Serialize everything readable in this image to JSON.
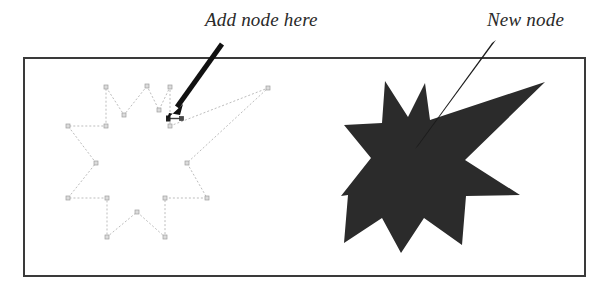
{
  "figure": {
    "name": "node-editing-illustration",
    "background_color": "#ffffff",
    "frame": {
      "name": "illustration-frame",
      "x": 23,
      "y": 57,
      "width": 563,
      "height": 220,
      "border_color": "#3a3a3a",
      "border_width": 2,
      "fill_color": "#ffffff"
    }
  },
  "annotations": [
    {
      "id": "add-node-here",
      "label": "Add node here",
      "text_color": "#2a2a2a",
      "font_style": "italic-serif",
      "font_size": 19,
      "pointer": {
        "type": "thick-solid-arrow",
        "color": "#111111",
        "from_x": 222,
        "from_y": 44,
        "to_x": 170,
        "to_y": 116,
        "line_width": 5,
        "head_length": 17,
        "head_width": 13
      }
    },
    {
      "id": "new-node",
      "label": "New node",
      "text_color": "#2a2a2a",
      "font_style": "italic-serif",
      "font_size": 19,
      "pointer": {
        "type": "thin-tapered-arrow",
        "color": "#1a1a1a",
        "from_x": 495,
        "from_y": 41,
        "to_x": 415,
        "to_y": 148,
        "line_width": 2.2
      }
    }
  ],
  "left_shape": {
    "name": "star-outline-with-nodes",
    "description": "8-point star path shown as editable outline with node handles, one point dragged into a long spike",
    "path_stroke_color": "#b9b9b9",
    "path_stroke_width": 1,
    "path_dash": "2 2",
    "node_handle": {
      "size": 4,
      "fill_color": "#d9d9d9",
      "stroke_color": "#9a9a9a"
    },
    "vertices": [
      {
        "x": 147,
        "y": 86,
        "role": "outer-point-top"
      },
      {
        "x": 124,
        "y": 115,
        "role": "inner-notch"
      },
      {
        "x": 106,
        "y": 87,
        "role": "outer-point-upper-left"
      },
      {
        "x": 106,
        "y": 126,
        "role": "inner-notch"
      },
      {
        "x": 68,
        "y": 126,
        "role": "outer-point-left-upper"
      },
      {
        "x": 96,
        "y": 163,
        "role": "inner-notch"
      },
      {
        "x": 68,
        "y": 198,
        "role": "outer-point-left-lower"
      },
      {
        "x": 107,
        "y": 198,
        "role": "inner-notch"
      },
      {
        "x": 107,
        "y": 237,
        "role": "outer-point-bottom-left"
      },
      {
        "x": 137,
        "y": 212,
        "role": "inner-notch"
      },
      {
        "x": 165,
        "y": 237,
        "role": "outer-point-bottom-right"
      },
      {
        "x": 165,
        "y": 198,
        "role": "inner-notch"
      },
      {
        "x": 207,
        "y": 198,
        "role": "outer-point-right-lower"
      },
      {
        "x": 187,
        "y": 163,
        "role": "inner-notch"
      },
      {
        "x": 268,
        "y": 88,
        "role": "outer-point-long-spike"
      },
      {
        "x": 170,
        "y": 126,
        "role": "inner-notch-selected"
      },
      {
        "x": 170,
        "y": 87,
        "role": "outer-point-upper-right"
      },
      {
        "x": 159,
        "y": 110,
        "role": "inner-notch"
      }
    ],
    "selected_node": {
      "x": 170,
      "y": 119,
      "label": "selected-node-with-control-handles",
      "fill_color": "#1f1f1f"
    }
  },
  "right_shape": {
    "name": "star-filled-result",
    "description": "Resulting filled 8-point star after adding the new node, with long spike to upper right",
    "fill_color": "#2b2b2b",
    "stroke": "none",
    "vertices": [
      {
        "x": 385,
        "y": 81
      },
      {
        "x": 408,
        "y": 117
      },
      {
        "x": 425,
        "y": 83
      },
      {
        "x": 430,
        "y": 120
      },
      {
        "x": 545,
        "y": 82
      },
      {
        "x": 465,
        "y": 160
      },
      {
        "x": 520,
        "y": 195
      },
      {
        "x": 466,
        "y": 196
      },
      {
        "x": 462,
        "y": 245
      },
      {
        "x": 424,
        "y": 218
      },
      {
        "x": 401,
        "y": 253
      },
      {
        "x": 382,
        "y": 218
      },
      {
        "x": 344,
        "y": 243
      },
      {
        "x": 348,
        "y": 195
      },
      {
        "x": 341,
        "y": 196
      },
      {
        "x": 371,
        "y": 158
      },
      {
        "x": 344,
        "y": 125
      },
      {
        "x": 382,
        "y": 123
      }
    ]
  }
}
